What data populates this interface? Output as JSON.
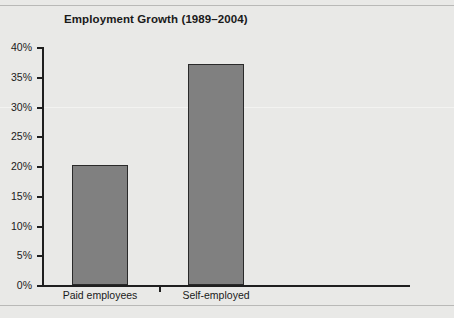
{
  "chart_data": {
    "type": "bar",
    "title": "Employment Growth (1989–2004)",
    "categories": [
      "Paid employees",
      "Self-employed"
    ],
    "values": [
      20.2,
      37.2
    ],
    "xlabel": "",
    "ylabel": "",
    "ylim": [
      0,
      40
    ],
    "ytick_values": [
      40,
      35,
      30,
      25,
      20,
      15,
      10,
      5,
      0
    ],
    "ytick_labels": [
      "40%",
      "35%",
      "30%",
      "25%",
      "20%",
      "15%",
      "10%",
      "5%",
      "0%"
    ],
    "grid": false,
    "legend": null,
    "colors": {
      "bar_fill": "#808080",
      "bar_edge": "#2a2a2a",
      "background": "#e9e9e7",
      "axis": "#1f1f1f",
      "text": "#1a1a1a"
    }
  }
}
